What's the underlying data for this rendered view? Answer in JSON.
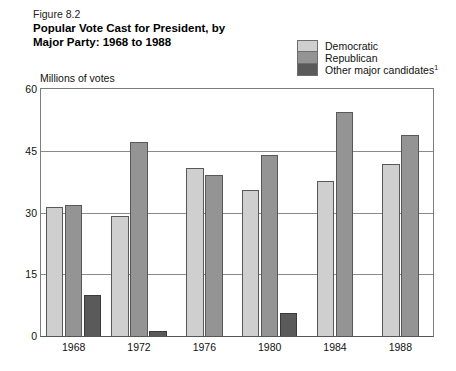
{
  "figure_label": "Figure 8.2",
  "title_line1": "Popular Vote Cast for President, by",
  "title_line2": "Major Party: 1968 to 1988",
  "y_axis_title": "Millions of votes",
  "legend": [
    {
      "label": "Democratic",
      "color": "#cfcfcf"
    },
    {
      "label": "Republican",
      "color": "#949494"
    },
    {
      "label": "Other major candidates",
      "footnote": "1",
      "color": "#5a5a5a"
    }
  ],
  "chart_data": {
    "type": "bar",
    "title": "Popular Vote Cast for President, by Major Party: 1968 to 1988",
    "xlabel": "",
    "ylabel": "Millions of votes",
    "ylim": [
      0,
      60
    ],
    "yticks": [
      0,
      15,
      30,
      45,
      60
    ],
    "grid": true,
    "legend_position": "top-right",
    "categories": [
      "1968",
      "1972",
      "1976",
      "1980",
      "1984",
      "1988"
    ],
    "series": [
      {
        "name": "Democratic",
        "color": "#cfcfcf",
        "values": [
          31.3,
          29.2,
          40.8,
          35.5,
          37.6,
          41.8
        ]
      },
      {
        "name": "Republican",
        "color": "#949494",
        "values": [
          31.8,
          47.2,
          39.1,
          43.9,
          54.5,
          48.9
        ]
      },
      {
        "name": "Other major candidates",
        "color": "#5a5a5a",
        "values": [
          9.9,
          1.1,
          null,
          5.7,
          null,
          null
        ]
      }
    ]
  }
}
